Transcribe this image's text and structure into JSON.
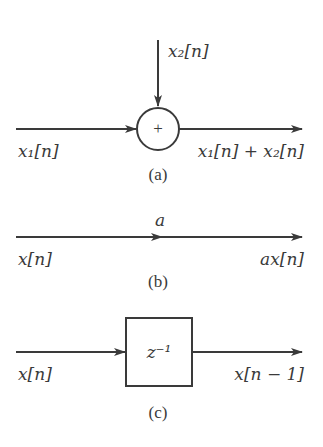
{
  "diagram": {
    "panels": [
      {
        "id": "a",
        "caption": "(a)",
        "type": "adder",
        "input_left_label": "x₁[n]",
        "input_top_label": "x₂[n]",
        "node_symbol": "+",
        "output_label": "x₁[n] + x₂[n]"
      },
      {
        "id": "b",
        "caption": "(b)",
        "type": "multiplier",
        "gain_label": "a",
        "input_label": "x[n]",
        "output_label": "ax[n]"
      },
      {
        "id": "c",
        "caption": "(c)",
        "type": "unit-delay",
        "block_label": "z⁻¹",
        "input_label": "x[n]",
        "output_label": "x[n − 1]"
      }
    ],
    "colors": {
      "stroke": "#3a3a3a",
      "background": "#ffffff"
    }
  }
}
